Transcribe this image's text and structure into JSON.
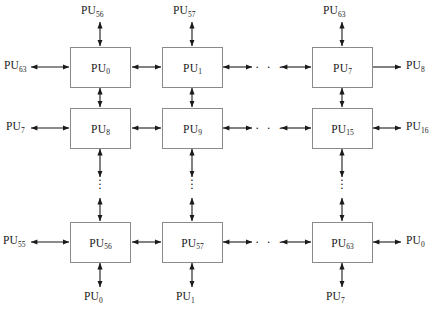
{
  "figure": {
    "type": "processor-interconnect-diagram",
    "topology": "2D torus mesh of processing units",
    "grid": {
      "rows_shown": 3,
      "cols_shown": 4,
      "total_units": 64
    },
    "colors": {
      "box_border": "#8a8a8a",
      "arrow": "#1a1a1a",
      "text": "#1a1a1a",
      "background": "#ffffff"
    }
  },
  "nodes": [
    {
      "id": "pu-0",
      "base": "PU",
      "sub": "0",
      "row": 0,
      "col": 0
    },
    {
      "id": "pu-1",
      "base": "PU",
      "sub": "1",
      "row": 0,
      "col": 1
    },
    {
      "id": "pu-7",
      "base": "PU",
      "sub": "7",
      "row": 0,
      "col": 3
    },
    {
      "id": "pu-8",
      "base": "PU",
      "sub": "8",
      "row": 1,
      "col": 0
    },
    {
      "id": "pu-9",
      "base": "PU",
      "sub": "9",
      "row": 1,
      "col": 1
    },
    {
      "id": "pu-15",
      "base": "PU",
      "sub": "15",
      "row": 1,
      "col": 3
    },
    {
      "id": "pu-56",
      "base": "PU",
      "sub": "56",
      "row": 2,
      "col": 0
    },
    {
      "id": "pu-57",
      "base": "PU",
      "sub": "57",
      "row": 2,
      "col": 1
    },
    {
      "id": "pu-63",
      "base": "PU",
      "sub": "63",
      "row": 2,
      "col": 3
    }
  ],
  "top_labels": [
    {
      "id": "top-col-0",
      "base": "PU",
      "sub": "56"
    },
    {
      "id": "top-col-1",
      "base": "PU",
      "sub": "57"
    },
    {
      "id": "top-col-3",
      "base": "PU",
      "sub": "63"
    }
  ],
  "bottom_labels": [
    {
      "id": "bottom-col-0",
      "base": "PU",
      "sub": "0"
    },
    {
      "id": "bottom-col-1",
      "base": "PU",
      "sub": "1"
    },
    {
      "id": "bottom-col-3",
      "base": "PU",
      "sub": "7"
    }
  ],
  "left_labels": [
    {
      "id": "left-row-0",
      "base": "PU",
      "sub": "63"
    },
    {
      "id": "left-row-1",
      "base": "PU",
      "sub": "7"
    },
    {
      "id": "left-row-2",
      "base": "PU",
      "sub": "55"
    }
  ],
  "right_labels": [
    {
      "id": "right-row-0",
      "base": "PU",
      "sub": "8"
    },
    {
      "id": "right-row-1",
      "base": "PU",
      "sub": "16"
    },
    {
      "id": "right-row-2",
      "base": "PU",
      "sub": "0"
    }
  ],
  "ellipses": {
    "horizontal": "· · ·",
    "vertical": [
      "·",
      "·",
      "·"
    ]
  }
}
